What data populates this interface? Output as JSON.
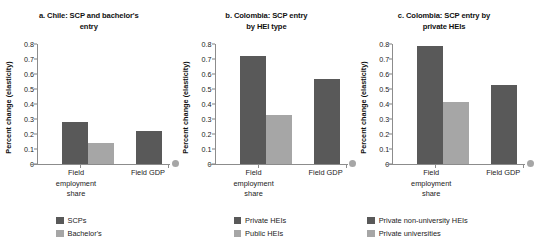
{
  "chart_data": [
    {
      "type": "bar",
      "panel_id": "a",
      "title": "a. Chile: SCP and bachelor's entry",
      "xlabel": "",
      "ylabel": "Percent change (elasticity)",
      "categories": [
        "Field employment share",
        "Field GDP"
      ],
      "ylim": [
        0,
        0.8
      ],
      "yticks": [
        "0.8",
        "0.7",
        "0.6",
        "0.5",
        "0.4",
        "0.3",
        "0.2",
        "0.1",
        "0"
      ],
      "ytick_values": [
        0.8,
        0.7,
        0.6,
        0.5,
        0.4,
        0.3,
        0.2,
        0.1,
        0
      ],
      "grid": false,
      "legend_position": "bottom",
      "series": [
        {
          "name": "SCPs",
          "color": "#595959",
          "values": [
            0.28,
            0.22
          ]
        },
        {
          "name": "Bachelor's",
          "color": "#a6a6a6",
          "values": [
            0.14,
            0.0
          ]
        }
      ]
    },
    {
      "type": "bar",
      "panel_id": "b",
      "title": "b. Colombia: SCP entry by HEI type",
      "xlabel": "",
      "ylabel": "Percent change (elasticity)",
      "categories": [
        "Field employment share",
        "Field GDP"
      ],
      "ylim": [
        0,
        0.8
      ],
      "yticks": [
        "0.8",
        "0.7",
        "0.6",
        "0.5",
        "0.4",
        "0.3",
        "0.2",
        "0.1",
        "0"
      ],
      "ytick_values": [
        0.8,
        0.7,
        0.6,
        0.5,
        0.4,
        0.3,
        0.2,
        0.1,
        0
      ],
      "grid": false,
      "legend_position": "bottom",
      "series": [
        {
          "name": "Private HEIs",
          "color": "#595959",
          "values": [
            0.72,
            0.57
          ]
        },
        {
          "name": "Public HEIs",
          "color": "#a6a6a6",
          "values": [
            0.33,
            0.0
          ]
        }
      ]
    },
    {
      "type": "bar",
      "panel_id": "c",
      "title": "c. Colombia: SCP entry by private HEIs",
      "xlabel": "",
      "ylabel": "Percent change (elasticity)",
      "categories": [
        "Field employment share",
        "Field GDP"
      ],
      "ylim": [
        0,
        0.8
      ],
      "yticks": [
        "0.8",
        "0.7",
        "0.6",
        "0.5",
        "0.4",
        "0.3",
        "0.2",
        "0.1",
        "0"
      ],
      "ytick_values": [
        0.8,
        0.7,
        0.6,
        0.5,
        0.4,
        0.3,
        0.2,
        0.1,
        0
      ],
      "grid": false,
      "legend_position": "bottom",
      "series": [
        {
          "name": "Private non-university HEIs",
          "color": "#595959",
          "values": [
            0.79,
            0.53
          ]
        },
        {
          "name": "Private universities",
          "color": "#a6a6a6",
          "values": [
            0.415,
            0.0
          ]
        }
      ]
    }
  ],
  "panels": [
    {
      "title_line1": "a. Chile: SCP and bachelor's",
      "title_line2": "entry",
      "ylabel": "Percent change (elasticity)",
      "cat1_line1": "Field",
      "cat1_line2": "employment",
      "cat1_line3": "share",
      "cat2_line1": "Field GDP",
      "legend1": "SCPs",
      "legend2": "Bachelor's"
    },
    {
      "title_line1": "b. Colombia: SCP entry",
      "title_line2": "by HEI type",
      "ylabel": "Percent change (elasticity)",
      "cat1_line1": "Field",
      "cat1_line2": "employment",
      "cat1_line3": "share",
      "cat2_line1": "Field GDP",
      "legend1": "Private HEIs",
      "legend2": "Public HEIs"
    },
    {
      "title_line1": "c. Colombia: SCP entry by",
      "title_line2": "private HEIs",
      "ylabel": "Percent change (elasticity)",
      "cat1_line1": "Field",
      "cat1_line2": "employment",
      "cat1_line3": "share",
      "cat2_line1": "Field GDP",
      "legend1": "Private non-university HEIs",
      "legend2": "Private universities"
    }
  ],
  "colors": {
    "series1": "#595959",
    "series2": "#a6a6a6",
    "axis": "#8c8c8c",
    "text": "#222222",
    "background": "#ffffff"
  }
}
